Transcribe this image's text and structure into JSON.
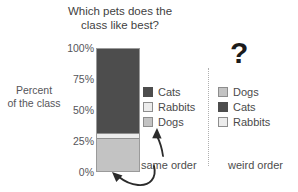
{
  "chart_data": {
    "type": "bar",
    "title": "Which pets does the class like best?",
    "title_lines": [
      "Which pets does the",
      "class like best?"
    ],
    "xlabel": "",
    "ylabel": "Percent of the class",
    "ylabel_lines": [
      "Percent",
      "of the class"
    ],
    "stacked": true,
    "categories": [
      ""
    ],
    "ylim": [
      0,
      100
    ],
    "ytick_labels": [
      "100%",
      "75%",
      "50%",
      "25%",
      "0%"
    ],
    "ytick_values": [
      100,
      75,
      50,
      25,
      0
    ],
    "grid": false,
    "series": [
      {
        "name": "Dogs",
        "values": [
          26
        ],
        "color": "#c3c3c3",
        "stack_from": 0,
        "stack_to": 26
      },
      {
        "name": "Rabbits",
        "values": [
          5
        ],
        "color": "#ececec",
        "stack_from": 26,
        "stack_to": 31
      },
      {
        "name": "Cats",
        "values": [
          69
        ],
        "color": "#4d4d4d",
        "stack_from": 31,
        "stack_to": 100
      }
    ],
    "legends": [
      {
        "position": "right-of-bar",
        "caption": "same order",
        "entries": [
          {
            "label": "Cats",
            "color": "#4d4d4d"
          },
          {
            "label": "Rabbits",
            "color": "#ececec"
          },
          {
            "label": "Dogs",
            "color": "#c3c3c3"
          }
        ]
      },
      {
        "position": "far-right",
        "caption": "weird order",
        "marker": "?",
        "entries": [
          {
            "label": "Dogs",
            "color": "#c3c3c3"
          },
          {
            "label": "Cats",
            "color": "#4d4d4d"
          },
          {
            "label": "Rabbits",
            "color": "#ececec"
          }
        ]
      }
    ],
    "annotations": [
      {
        "text": "same order",
        "kind": "caption"
      },
      {
        "text": "weird order",
        "kind": "caption"
      },
      {
        "text": "?",
        "kind": "question-mark"
      }
    ]
  },
  "title": {
    "line1": "Which pets does the",
    "line2": "class like best?"
  },
  "axis": {
    "y_label_line1": "Percent",
    "y_label_line2": "of the class",
    "ticks": {
      "t100": "100%",
      "t75": "75%",
      "t50": "50%",
      "t25": "25%",
      "t0": "0%"
    }
  },
  "legend_left": {
    "items": [
      {
        "label": "Cats"
      },
      {
        "label": "Rabbits"
      },
      {
        "label": "Dogs"
      }
    ]
  },
  "legend_right": {
    "items": [
      {
        "label": "Dogs"
      },
      {
        "label": "Cats"
      },
      {
        "label": "Rabbits"
      }
    ]
  },
  "captions": {
    "same_order": "same order",
    "weird_order": "weird order",
    "question_mark": "?"
  },
  "colors": {
    "cats": "#4d4d4d",
    "rabbits": "#ececec",
    "dogs": "#c3c3c3",
    "text": "#4a4a4a",
    "divider": "#b0b0b0"
  }
}
